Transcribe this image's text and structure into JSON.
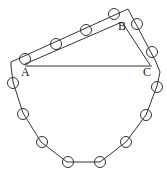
{
  "diagram": {
    "labels": {
      "A": "A",
      "B": "B",
      "C": "C"
    },
    "colors": {
      "stroke": "#333333",
      "background": "#ffffff"
    },
    "bead_count": 14
  }
}
